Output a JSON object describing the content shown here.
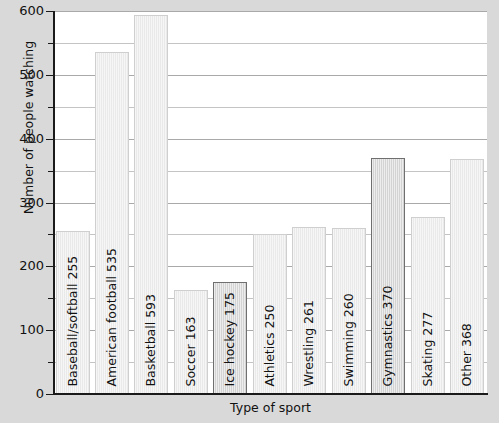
{
  "chart_data": {
    "type": "bar",
    "title": "",
    "xlabel": "Type of sport",
    "ylabel": "Number of people watching",
    "ylim": [
      0,
      600
    ],
    "yticks": [
      0,
      100,
      200,
      300,
      400,
      500,
      600
    ],
    "ytick_labels": [
      "0",
      "100",
      "200",
      "300",
      "400",
      "500",
      "600"
    ],
    "minor_tick_step": 50,
    "grid": true,
    "legend": "none",
    "categories": [
      "Baseball/softball",
      "American football",
      "Basketball",
      "Soccer",
      "Ice hockey",
      "Athletics",
      "Wrestling",
      "Swimming",
      "Gymnastics",
      "Skating",
      "Other"
    ],
    "values": [
      255,
      535,
      593,
      163,
      175,
      250,
      261,
      260,
      370,
      277,
      368
    ],
    "bar_labels": [
      "Baseball/softball  255",
      "American football  535",
      "Basketball  593",
      "Soccer  163",
      "Ice hockey  175",
      "Athletics  250",
      "Wrestling  261",
      "Swimming  260",
      "Gymnastics  370",
      "Skating  277",
      "Other  368"
    ],
    "bar_styles": [
      "light",
      "light",
      "light",
      "light",
      "dark",
      "light",
      "light",
      "light",
      "dark",
      "light",
      "light"
    ],
    "colors": {
      "background": "#d9d9d9",
      "plot_background": "#ffffff",
      "bar_light_fill": "#ececec",
      "bar_light_border": "#cfcfcf",
      "bar_dark_fill": "#dedede",
      "bar_dark_border": "#6f6f6f",
      "axis": "#1a1a1a",
      "gridline": "#a9a9a9",
      "text": "#111111"
    }
  }
}
